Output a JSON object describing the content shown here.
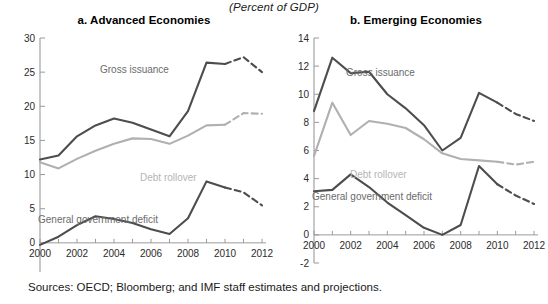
{
  "figure": {
    "units_header": "(Percent of GDP)",
    "source_note": "Sources: OECD; Bloomberg; and IMF staff estimates and projections."
  },
  "colors": {
    "dark_line": "#4d4d4d",
    "light_line": "#b0b0b0",
    "axis": "#9a9a9a",
    "text": "#1a1a1a"
  },
  "panel_a": {
    "title": "a. Advanced Economies",
    "annotations": {
      "gross_issuance": "Gross issuance",
      "debt_rollover": "Debt rollover",
      "general_government_deficit": "General government deficit"
    }
  },
  "panel_b": {
    "title": "b. Emerging Economies",
    "annotations": {
      "gross_issuance": "Gross issuance",
      "debt_rollover": "Debt rollover",
      "general_government_deficit": "General government deficit"
    }
  },
  "chart_data": [
    {
      "type": "line",
      "title": "a. Advanced Economies",
      "xlabel": "",
      "ylabel": "",
      "units": "Percent of GDP",
      "grid": false,
      "legend_position": "inline-annotations",
      "x": [
        2000,
        2001,
        2002,
        2003,
        2004,
        2005,
        2006,
        2007,
        2008,
        2009,
        2010,
        2011,
        2012
      ],
      "xticks": [
        "2000",
        "2002",
        "2004",
        "2006",
        "2008",
        "2010",
        "2012"
      ],
      "xtick_values": [
        2000,
        2002,
        2004,
        2006,
        2008,
        2010,
        2012
      ],
      "xlim": [
        2000,
        2012
      ],
      "yticks": [
        -5,
        0,
        5,
        10,
        15,
        20,
        25,
        30
      ],
      "ytick_labels": [
        "-5",
        "0",
        "5",
        "10",
        "15",
        "20",
        "25",
        "30"
      ],
      "ylim": [
        -5,
        30
      ],
      "projection_starts": 2010,
      "series": [
        {
          "name": "Gross issuance",
          "style": "solid-to-dashed",
          "color": "#4d4d4d",
          "values": [
            12.2,
            12.8,
            15.6,
            17.2,
            18.2,
            17.6,
            16.6,
            15.6,
            19.3,
            26.4,
            26.2,
            27.2,
            25.0
          ]
        },
        {
          "name": "Debt rollover",
          "style": "solid-to-dashed",
          "color": "#b0b0b0",
          "values": [
            11.8,
            10.9,
            12.3,
            13.5,
            14.5,
            15.3,
            15.2,
            14.5,
            15.7,
            17.2,
            17.3,
            19.0,
            18.9
          ]
        },
        {
          "name": "General government deficit",
          "style": "solid-to-dashed",
          "color": "#4d4d4d",
          "values": [
            -0.3,
            0.9,
            2.6,
            3.9,
            3.5,
            2.9,
            2.0,
            1.3,
            3.6,
            9.0,
            8.1,
            7.4,
            5.5
          ]
        }
      ]
    },
    {
      "type": "line",
      "title": "b. Emerging Economies",
      "xlabel": "",
      "ylabel": "",
      "units": "Percent of GDP",
      "grid": false,
      "legend_position": "inline-annotations",
      "x": [
        2000,
        2001,
        2002,
        2003,
        2004,
        2005,
        2006,
        2007,
        2008,
        2009,
        2010,
        2011,
        2012
      ],
      "xticks": [
        "2000",
        "2002",
        "2004",
        "2006",
        "2008",
        "2010",
        "2012"
      ],
      "xtick_values": [
        2000,
        2002,
        2004,
        2006,
        2008,
        2010,
        2012
      ],
      "xlim": [
        2000,
        2012
      ],
      "yticks": [
        -2,
        0,
        2,
        4,
        6,
        8,
        10,
        12,
        14
      ],
      "ytick_labels": [
        "-2",
        "0",
        "2",
        "4",
        "6",
        "8",
        "10",
        "12",
        "14"
      ],
      "ylim": [
        -2,
        14
      ],
      "projection_starts": 2010,
      "series": [
        {
          "name": "Gross issuance",
          "style": "solid-to-dashed",
          "color": "#4d4d4d",
          "values": [
            8.8,
            12.6,
            11.5,
            11.6,
            10.0,
            9.0,
            7.8,
            6.0,
            6.9,
            10.1,
            9.4,
            8.6,
            8.1
          ]
        },
        {
          "name": "Debt rollover",
          "style": "solid-to-dashed",
          "color": "#b0b0b0",
          "values": [
            5.6,
            9.4,
            7.1,
            8.1,
            7.9,
            7.6,
            6.8,
            5.8,
            5.4,
            5.3,
            5.2,
            5.0,
            5.2
          ]
        },
        {
          "name": "General government deficit",
          "style": "solid-to-dashed",
          "color": "#4d4d4d",
          "values": [
            3.1,
            3.2,
            4.3,
            3.4,
            2.3,
            1.4,
            0.5,
            0.0,
            0.7,
            4.9,
            3.6,
            2.8,
            2.2
          ]
        }
      ]
    }
  ]
}
